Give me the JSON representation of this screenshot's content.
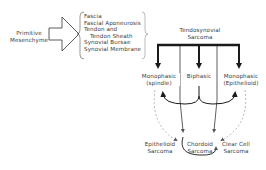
{
  "diagram": {
    "origin": {
      "line1": "Primitive",
      "line2": "Mesenchyme"
    },
    "tissues": [
      "Fascia",
      "Fascial Aponeurosis",
      "Tendon and",
      "Tendon Sheath",
      "Synovial Bursae",
      "Synovial Membrane"
    ],
    "root": {
      "line1": "Tendosynovial",
      "line2": "Sarcoma"
    },
    "subtypes": [
      {
        "line1": "Monophasic",
        "line2": "(spindle)"
      },
      {
        "line1": "Biphasic",
        "line2": ""
      },
      {
        "line1": "Monophasic",
        "line2": "(Epithelioid)"
      }
    ],
    "related": [
      {
        "line1": "Epithelioid",
        "line2": "Sarcoma"
      },
      {
        "line1": "Chordoid",
        "line2": "Sarcoma"
      },
      {
        "line1": "Clear Cell",
        "line2": "Sarcoma"
      }
    ],
    "colors": {
      "line": "#1a1a1a",
      "text": "#3a3a3a",
      "dashed": "#888888"
    }
  }
}
